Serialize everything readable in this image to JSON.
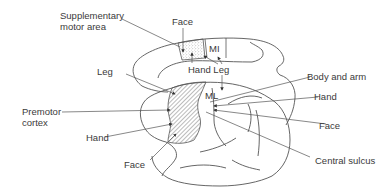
{
  "diagram": {
    "type": "anatomical-brain-motor-areas",
    "colors": {
      "outline": "#555555",
      "text": "#3a3a3a",
      "leader": "#555555",
      "hatch": "#777777",
      "stipple": "#888888",
      "background": "#ffffff"
    },
    "regions": {
      "mi_top": "MI",
      "mi_lateral": "ML"
    },
    "labels": {
      "supplementary_motor_area_line1": "Supplementary",
      "supplementary_motor_area_line2": "motor area",
      "face_top": "Face",
      "hand_leg_top": "Hand Leg",
      "leg": "Leg",
      "body_and_arm": "Body and arm",
      "hand_right": "Hand",
      "premotor_cortex_line1": "Premotor",
      "premotor_cortex_line2": "cortex",
      "hand_left": "Hand",
      "face_right": "Face",
      "face_bottom": "Face",
      "central_sulcus": "Central sulcus"
    }
  }
}
